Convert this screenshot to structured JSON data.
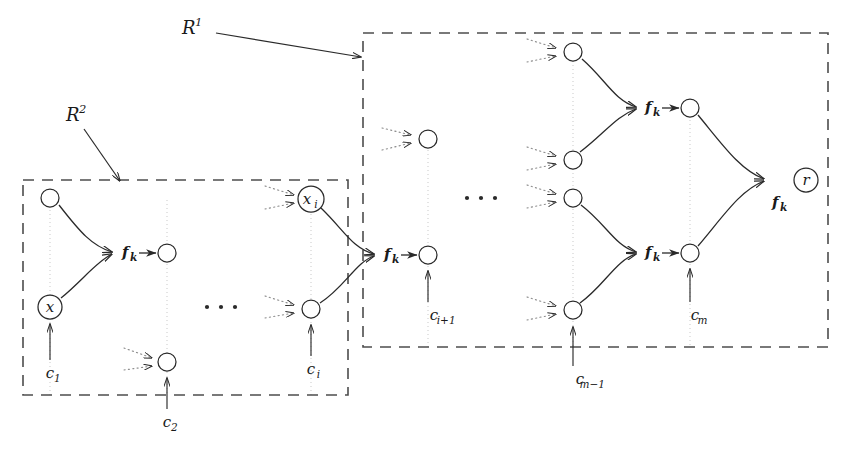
{
  "figure": {
    "background": "#ffffff",
    "ink": "#2a2a2a",
    "guide_color": "#c9c9c9",
    "dotted_color": "#8a8a8a"
  },
  "regions": [
    {
      "id": "R1",
      "label": "R",
      "superscript": "1",
      "label_x": 182,
      "label_y": 34,
      "box": {
        "x": 363,
        "y": 33,
        "w": 465,
        "h": 314
      },
      "pointer": {
        "x1": 216,
        "y1": 33,
        "x2": 361,
        "y2": 57
      }
    },
    {
      "id": "R2",
      "label": "R",
      "superscript": "2",
      "label_x": 66,
      "label_y": 121,
      "box": {
        "x": 23,
        "y": 180,
        "w": 325,
        "h": 215
      },
      "pointer": {
        "x1": 84,
        "y1": 129,
        "x2": 120,
        "y2": 181
      }
    }
  ],
  "function_labels": [
    {
      "id": "fk-left",
      "base": "f",
      "sub": "k",
      "x": 122,
      "y": 257
    },
    {
      "id": "fk-mid",
      "base": "f",
      "sub": "k",
      "x": 384,
      "y": 259
    },
    {
      "id": "fk-upper",
      "base": "f",
      "sub": "k",
      "x": 645,
      "y": 112
    },
    {
      "id": "fk-lower",
      "base": "f",
      "sub": "k",
      "x": 645,
      "y": 257
    },
    {
      "id": "fk-root",
      "base": "f",
      "sub": "k",
      "x": 772,
      "y": 207
    }
  ],
  "nodes": [
    {
      "id": "n-top-left",
      "x": 50,
      "y": 198,
      "r": 9,
      "label": "",
      "sub": ""
    },
    {
      "id": "n-x",
      "x": 50,
      "y": 307,
      "r": 12,
      "label": "x",
      "sub": ""
    },
    {
      "id": "n-out-left",
      "x": 167,
      "y": 253,
      "r": 9,
      "label": "",
      "sub": ""
    },
    {
      "id": "n-c2",
      "x": 167,
      "y": 362,
      "r": 9,
      "label": "",
      "sub": ""
    },
    {
      "id": "n-xi",
      "x": 311,
      "y": 199,
      "r": 13,
      "label": "x",
      "sub": "i"
    },
    {
      "id": "n-ci",
      "x": 311,
      "y": 309,
      "r": 9,
      "label": "",
      "sub": ""
    },
    {
      "id": "n-out-mid",
      "x": 428,
      "y": 255,
      "r": 9,
      "label": "",
      "sub": ""
    },
    {
      "id": "n-r1",
      "x": 573,
      "y": 52,
      "r": 9,
      "label": "",
      "sub": ""
    },
    {
      "id": "n-r2",
      "x": 573,
      "y": 160,
      "r": 9,
      "label": "",
      "sub": ""
    },
    {
      "id": "n-r3",
      "x": 573,
      "y": 198,
      "r": 9,
      "label": "",
      "sub": ""
    },
    {
      "id": "n-r4",
      "x": 573,
      "y": 310,
      "r": 9,
      "label": "",
      "sub": ""
    },
    {
      "id": "n-out-upper",
      "x": 690,
      "y": 108,
      "r": 9,
      "label": "",
      "sub": ""
    },
    {
      "id": "n-out-lower",
      "x": 690,
      "y": 253,
      "r": 9,
      "label": "",
      "sub": ""
    },
    {
      "id": "n-root",
      "x": 806,
      "y": 180,
      "r": 12,
      "label": "r",
      "sub": ""
    },
    {
      "id": "n-float",
      "x": 428,
      "y": 139,
      "r": 9,
      "label": "",
      "sub": ""
    }
  ],
  "annotations": [
    {
      "id": "c1",
      "base": "c",
      "sub": "1",
      "text_x": 50,
      "text_y": 378,
      "arrow": {
        "x1": 50,
        "y1": 360,
        "x2": 50,
        "y2": 324
      }
    },
    {
      "id": "c2",
      "base": "c",
      "sub": "2",
      "text_x": 167,
      "text_y": 427,
      "arrow": {
        "x1": 167,
        "y1": 409,
        "x2": 167,
        "y2": 378
      }
    },
    {
      "id": "ci",
      "base": "c",
      "sub": "i",
      "text_x": 311,
      "text_y": 374,
      "arrow": {
        "x1": 311,
        "y1": 356,
        "x2": 311,
        "y2": 325
      }
    },
    {
      "id": "ci1",
      "base": "c",
      "sub": "i+1",
      "text_x": 434,
      "text_y": 320,
      "arrow": {
        "x1": 428,
        "y1": 302,
        "x2": 428,
        "y2": 271
      }
    },
    {
      "id": "cm1",
      "base": "c",
      "sub": "m−1",
      "text_x": 580,
      "text_y": 384,
      "arrow": {
        "x1": 573,
        "y1": 366,
        "x2": 573,
        "y2": 327
      }
    },
    {
      "id": "cm",
      "base": "c",
      "sub": "m",
      "text_x": 695,
      "text_y": 320,
      "arrow": {
        "x1": 690,
        "y1": 302,
        "x2": 690,
        "y2": 269
      }
    }
  ],
  "ellipses": [
    {
      "id": "ellipsis-left",
      "x": 221,
      "y": 307
    },
    {
      "id": "ellipsis-right",
      "x": 481,
      "y": 198
    }
  ],
  "edges": [
    {
      "id": "e-topleft-to-out",
      "d": "M 59 205 C 80 232, 92 246, 112 252"
    },
    {
      "id": "e-x-to-out",
      "d": "M 61 298 C 82 281, 96 262, 112 254"
    },
    {
      "id": "e-xi-to-out",
      "d": "M 321 208 C 344 230, 352 248, 374 254"
    },
    {
      "id": "e-ci-to-out",
      "d": "M 320 303 C 344 288, 356 262, 374 256"
    },
    {
      "id": "e-r1-to-upper",
      "d": "M 582 59 C 606 80, 614 100, 636 107"
    },
    {
      "id": "e-r2-to-upper",
      "d": "M 580 152 C 604 134, 616 116, 636 109"
    },
    {
      "id": "e-r3-to-lower",
      "d": "M 581 205 C 606 224, 615 246, 636 252"
    },
    {
      "id": "e-r4-to-lower",
      "d": "M 580 303 C 604 286, 616 260, 636 254"
    },
    {
      "id": "e-upper-to-root",
      "d": "M 698 115 C 722 144, 740 170, 764 179"
    },
    {
      "id": "e-lower-to-root",
      "d": "M 698 246 C 722 218, 740 190, 764 181"
    }
  ],
  "incoming_dotted": [
    {
      "id": "in-c2-a",
      "d": "M 124 348 L 152 358"
    },
    {
      "id": "in-c2-b",
      "d": "M 124 370 L 152 366"
    },
    {
      "id": "in-xi-a",
      "d": "M 265 186 L 294 195"
    },
    {
      "id": "in-xi-b",
      "d": "M 265 209 L 294 203"
    },
    {
      "id": "in-ci-a",
      "d": "M 265 296 L 294 305"
    },
    {
      "id": "in-ci-b",
      "d": "M 265 318 L 294 313"
    },
    {
      "id": "in-fl-a",
      "d": "M 382 128 L 411 135"
    },
    {
      "id": "in-fl-b",
      "d": "M 382 150 L 411 143"
    },
    {
      "id": "in-r1-a",
      "d": "M 527 39 L 556 48"
    },
    {
      "id": "in-r1-b",
      "d": "M 527 62 L 556 56"
    },
    {
      "id": "in-r2-a",
      "d": "M 527 147 L 556 156"
    },
    {
      "id": "in-r2-b",
      "d": "M 527 170 L 556 164"
    },
    {
      "id": "in-r3-a",
      "d": "M 527 185 L 556 194"
    },
    {
      "id": "in-r3-b",
      "d": "M 527 208 L 556 202"
    },
    {
      "id": "in-r4-a",
      "d": "M 527 297 L 556 306"
    },
    {
      "id": "in-r4-b",
      "d": "M 527 320 L 556 314"
    }
  ],
  "guides": [
    {
      "id": "guide-1",
      "x": 50,
      "y1": 190,
      "y2": 395
    },
    {
      "id": "guide-2",
      "x": 167,
      "y1": 200,
      "y2": 395
    },
    {
      "id": "guide-3",
      "x": 311,
      "y1": 190,
      "y2": 395
    },
    {
      "id": "guide-4",
      "x": 428,
      "y1": 150,
      "y2": 347
    },
    {
      "id": "guide-5",
      "x": 573,
      "y1": 45,
      "y2": 347
    },
    {
      "id": "guide-6",
      "x": 690,
      "y1": 100,
      "y2": 347
    }
  ]
}
